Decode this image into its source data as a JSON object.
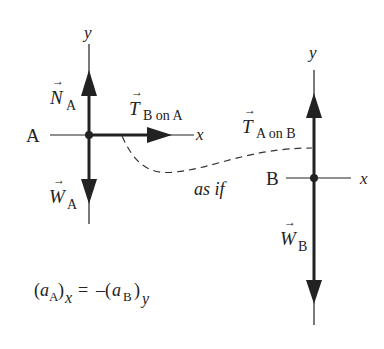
{
  "particle_A": {
    "label": "A",
    "axes": {
      "x": "x",
      "y": "y"
    },
    "forces": {
      "normal": {
        "symbol": "N",
        "subscript": "A"
      },
      "weight": {
        "symbol": "W",
        "subscript": "A"
      },
      "tension": {
        "symbol": "T",
        "subscript": "B on A"
      }
    }
  },
  "particle_B": {
    "label": "B",
    "axes": {
      "x": "x",
      "y": "y"
    },
    "forces": {
      "tension": {
        "symbol": "T",
        "subscript": "A on B"
      },
      "weight": {
        "symbol": "W",
        "subscript": "B"
      }
    }
  },
  "connector_label": "as if",
  "equation": {
    "lhs_open": "(",
    "lhs_var": "a",
    "lhs_sub": "A",
    "lhs_close": ")",
    "lhs_comp": "x",
    "eq": " = ",
    "rhs_open": "–(",
    "rhs_var": "a",
    "rhs_sub": "B",
    "rhs_close": ")",
    "rhs_comp": "y"
  },
  "colors": {
    "ink": "#222222",
    "background": "#ffffff"
  }
}
